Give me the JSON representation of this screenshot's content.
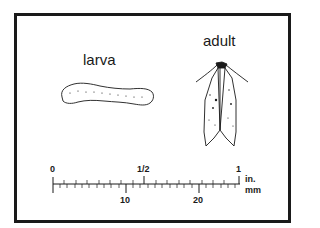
{
  "figure": {
    "labels": {
      "larva": "larva",
      "adult": "adult"
    },
    "scale": {
      "inch_ticks": [
        {
          "label": "0",
          "value": 0
        },
        {
          "label": "1/2",
          "value": 0.5
        },
        {
          "label": "1",
          "value": 1
        }
      ],
      "mm_ticks": [
        {
          "label": "10",
          "value": 10
        },
        {
          "label": "20",
          "value": 20
        }
      ],
      "unit_inch": "in.",
      "unit_mm": "mm"
    },
    "colors": {
      "ink": "#1a1a1a",
      "background": "#ffffff"
    }
  }
}
